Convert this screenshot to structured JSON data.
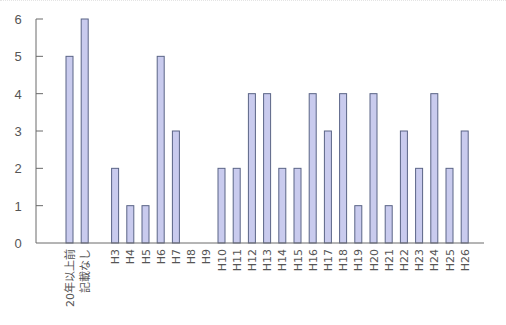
{
  "chart_data": {
    "type": "bar",
    "title": "",
    "xlabel": "",
    "ylabel": "",
    "ylim": [
      0,
      6
    ],
    "yticks": [
      0,
      1,
      2,
      3,
      4,
      5,
      6
    ],
    "grid": false,
    "legend": null,
    "categories": [
      "20年以上前",
      "記載なし",
      "",
      "H3",
      "H4",
      "H5",
      "H6",
      "H7",
      "H8",
      "H9",
      "H10",
      "H11",
      "H12",
      "H13",
      "H14",
      "H15",
      "H16",
      "H17",
      "H18",
      "H19",
      "H20",
      "H21",
      "H22",
      "H23",
      "H24",
      "H25",
      "H26"
    ],
    "values": [
      5,
      6,
      null,
      2,
      1,
      1,
      5,
      3,
      0,
      0,
      2,
      2,
      4,
      4,
      2,
      2,
      4,
      3,
      4,
      1,
      4,
      1,
      3,
      2,
      4,
      2,
      3
    ],
    "colors": {
      "bar_fill": "#c9cbee",
      "bar_stroke": "#5a6486",
      "axis": "#6a6a6a",
      "text": "#555555"
    }
  }
}
